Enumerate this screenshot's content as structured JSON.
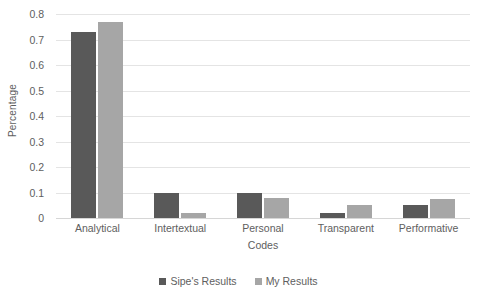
{
  "chart_data": {
    "type": "bar",
    "title": "",
    "subtitle": "",
    "xlabel": "Codes",
    "ylabel": "Percentage",
    "categories": [
      "Analytical",
      "Intertextual",
      "Personal",
      "Transparent",
      "Performative"
    ],
    "series": [
      {
        "name": "Sipe's Results",
        "color": "#595959",
        "values": [
          0.73,
          0.1,
          0.1,
          0.02,
          0.05
        ]
      },
      {
        "name": "My Results",
        "color": "#a6a6a6",
        "values": [
          0.77,
          0.02,
          0.08,
          0.05,
          0.075
        ]
      }
    ],
    "ylim": [
      0,
      0.8
    ],
    "ytick_step": 0.1,
    "ytick_labels": [
      "0.8",
      "0.7",
      "0.6",
      "0.5",
      "0.4",
      "0.3",
      "0.2",
      "0.1",
      "0"
    ],
    "ytick_values": [
      0.8,
      0.7,
      0.6,
      0.5,
      0.4,
      0.3,
      0.2,
      0.1,
      0
    ],
    "grid": true,
    "grid_axis": "y",
    "grid_color": "#e4e4e4",
    "legend_position": "bottom",
    "background": "#ffffff",
    "axis_lines": false
  }
}
